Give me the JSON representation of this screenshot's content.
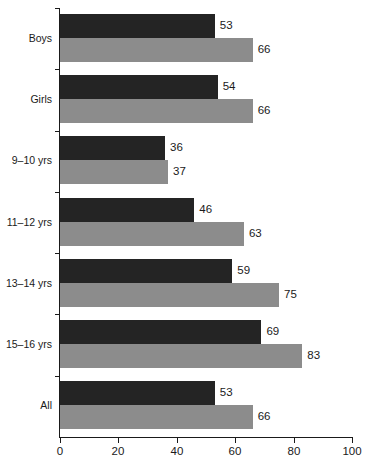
{
  "chart_data": {
    "type": "bar",
    "orientation": "horizontal",
    "title": "",
    "subtitle": "",
    "xlabel": "",
    "ylabel": "",
    "xlim": [
      0,
      100
    ],
    "grid": false,
    "legend": "none",
    "xticks": [
      0,
      20,
      40,
      60,
      80,
      100
    ],
    "xtick_labels": [
      "0",
      "20",
      "40",
      "60",
      "80",
      "100"
    ],
    "categories": [
      "Boys",
      "Girls",
      "9–10 yrs",
      "11–12 yrs",
      "13–14 yrs",
      "15–16 yrs",
      "All"
    ],
    "series": [
      {
        "name": "series-1",
        "color": "#242424",
        "values": [
          53,
          54,
          36,
          46,
          59,
          69,
          53
        ]
      },
      {
        "name": "series-2",
        "color": "#8c8c8c",
        "values": [
          66,
          66,
          37,
          63,
          75,
          83,
          66
        ]
      }
    ],
    "value_labels": [
      [
        "53",
        "66"
      ],
      [
        "54",
        "66"
      ],
      [
        "36",
        "37"
      ],
      [
        "46",
        "63"
      ],
      [
        "59",
        "75"
      ],
      [
        "69",
        "83"
      ],
      [
        "53",
        "66"
      ]
    ]
  },
  "colors": {
    "series_dark": "#242424",
    "series_grey": "#8c8c8c",
    "axis": "#1a1a1a",
    "background": "#ffffff"
  }
}
